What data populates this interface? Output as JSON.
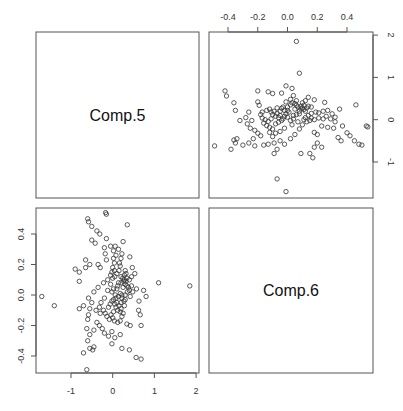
{
  "chart_data": {
    "type": "scatter",
    "title": "",
    "layout": "pairs-matrix 2x2",
    "variables": [
      "Comp.5",
      "Comp.6"
    ],
    "diagonal_labels": [
      "Comp.5",
      "Comp.6"
    ],
    "grid": false,
    "axes": {
      "comp5": {
        "ticks": [
          -0.4,
          -0.2,
          0.0,
          0.2,
          0.4
        ],
        "tick_labels": [
          "-0.4",
          "-0.2",
          "0.0",
          "0.2",
          "0.4"
        ],
        "range": [
          -0.5,
          0.55
        ]
      },
      "comp6": {
        "ticks": [
          -1,
          0,
          1,
          2
        ],
        "tick_labels": [
          "-1",
          "0",
          "1",
          "2"
        ],
        "range": [
          -1.75,
          2.0
        ]
      }
    },
    "panels": [
      {
        "position": "top-right",
        "x_var": "Comp.5",
        "y_var": "Comp.6",
        "x_axis_side": "top",
        "y_axis_side": "right"
      },
      {
        "position": "bottom-left",
        "x_var": "Comp.6",
        "y_var": "Comp.5",
        "x_axis_side": "bottom",
        "y_axis_side": "left"
      }
    ],
    "points_comp5_comp6": [
      [
        0.06,
        1.85
      ],
      [
        0.08,
        1.1
      ],
      [
        -0.49,
        -0.62
      ],
      [
        -0.07,
        -1.4
      ],
      [
        -0.01,
        -1.7
      ],
      [
        -0.42,
        0.68
      ],
      [
        -0.41,
        0.56
      ],
      [
        -0.2,
        0.68
      ],
      [
        -0.1,
        0.62
      ],
      [
        -0.13,
        0.66
      ],
      [
        -0.04,
        0.63
      ],
      [
        -0.01,
        0.8
      ],
      [
        0.03,
        0.74
      ],
      [
        0.04,
        0.57
      ],
      [
        0.14,
        0.53
      ],
      [
        0.18,
        0.47
      ],
      [
        0.25,
        0.41
      ],
      [
        -0.2,
        0.42
      ],
      [
        -0.19,
        0.34
      ],
      [
        -0.26,
        0.18
      ],
      [
        -0.24,
        -0.02
      ],
      [
        -0.18,
        0.12
      ],
      [
        -0.17,
        0.04
      ],
      [
        -0.12,
        0.25
      ],
      [
        -0.09,
        0.2
      ],
      [
        -0.07,
        0.15
      ],
      [
        -0.05,
        0.1
      ],
      [
        -0.04,
        0.27
      ],
      [
        -0.02,
        0.22
      ],
      [
        0.0,
        0.3
      ],
      [
        0.02,
        0.35
      ],
      [
        0.03,
        0.4
      ],
      [
        0.05,
        0.38
      ],
      [
        0.06,
        0.34
      ],
      [
        0.07,
        0.3
      ],
      [
        0.09,
        0.32
      ],
      [
        0.1,
        0.28
      ],
      [
        0.11,
        0.24
      ],
      [
        0.12,
        0.2
      ],
      [
        0.13,
        0.28
      ],
      [
        0.05,
        0.25
      ],
      [
        0.01,
        0.18
      ],
      [
        -0.01,
        0.14
      ],
      [
        -0.06,
        0.05
      ],
      [
        -0.08,
        0.08
      ],
      [
        -0.1,
        0.12
      ],
      [
        -0.11,
        0.02
      ],
      [
        -0.13,
        -0.04
      ],
      [
        -0.15,
        0.0
      ],
      [
        -0.16,
        -0.08
      ],
      [
        -0.14,
        -0.14
      ],
      [
        -0.12,
        -0.18
      ],
      [
        -0.1,
        -0.22
      ],
      [
        -0.08,
        -0.1
      ],
      [
        -0.06,
        -0.06
      ],
      [
        -0.03,
        0.02
      ],
      [
        0.0,
        0.06
      ],
      [
        0.02,
        -0.02
      ],
      [
        0.04,
        0.1
      ],
      [
        0.06,
        0.12
      ],
      [
        0.08,
        0.14
      ],
      [
        0.12,
        0.05
      ],
      [
        0.14,
        0.1
      ],
      [
        0.16,
        0.15
      ],
      [
        0.19,
        0.18
      ],
      [
        0.21,
        0.16
      ],
      [
        0.24,
        0.2
      ],
      [
        0.27,
        0.22
      ],
      [
        0.3,
        0.14
      ],
      [
        0.32,
        0.06
      ],
      [
        0.35,
        0.25
      ],
      [
        0.46,
        0.35
      ],
      [
        0.53,
        -0.15
      ],
      [
        0.54,
        -0.17
      ],
      [
        0.4,
        -0.31
      ],
      [
        0.37,
        -0.15
      ],
      [
        0.42,
        -0.38
      ],
      [
        0.45,
        -0.5
      ],
      [
        0.48,
        -0.58
      ],
      [
        0.5,
        -0.6
      ],
      [
        0.36,
        -0.5
      ],
      [
        0.34,
        -0.42
      ],
      [
        0.31,
        -0.2
      ],
      [
        0.27,
        -0.18
      ],
      [
        0.23,
        -0.15
      ],
      [
        0.2,
        -0.35
      ],
      [
        0.18,
        -0.3
      ],
      [
        0.2,
        -0.55
      ],
      [
        0.18,
        -0.65
      ],
      [
        0.17,
        -0.9
      ],
      [
        0.15,
        -0.8
      ],
      [
        0.23,
        -0.65
      ],
      [
        -0.23,
        -0.45
      ],
      [
        -0.26,
        -0.55
      ],
      [
        -0.22,
        -0.62
      ],
      [
        -0.3,
        -0.6
      ],
      [
        -0.35,
        -0.55
      ],
      [
        -0.36,
        -0.48
      ],
      [
        -0.34,
        -0.45
      ],
      [
        -0.38,
        -0.7
      ],
      [
        -0.32,
        -0.02
      ],
      [
        -0.35,
        0.22
      ],
      [
        -0.36,
        0.4
      ],
      [
        -0.28,
        0.05
      ],
      [
        -0.27,
        -0.1
      ],
      [
        -0.25,
        -0.2
      ],
      [
        -0.22,
        -0.25
      ],
      [
        -0.2,
        -0.32
      ],
      [
        -0.18,
        -0.38
      ],
      [
        -0.16,
        -0.6
      ],
      [
        -0.13,
        -0.58
      ],
      [
        -0.09,
        -0.55
      ],
      [
        -0.05,
        -0.5
      ],
      [
        -0.02,
        -0.58
      ],
      [
        0.02,
        -0.45
      ],
      [
        0.05,
        -0.35
      ],
      [
        0.08,
        -0.22
      ],
      [
        0.1,
        -0.12
      ],
      [
        0.07,
        -0.05
      ],
      [
        0.03,
        -0.12
      ],
      [
        -0.02,
        -0.2
      ],
      [
        -0.05,
        -0.28
      ],
      [
        -0.08,
        -0.32
      ],
      [
        -0.1,
        -0.4
      ],
      [
        -0.12,
        -0.3
      ],
      [
        -0.07,
        -0.7
      ],
      [
        -0.09,
        -0.8
      ],
      [
        0.09,
        -0.8
      ],
      [
        0.11,
        0.0
      ],
      [
        0.13,
        -0.05
      ],
      [
        0.15,
        -0.02
      ],
      [
        0.16,
        0.04
      ],
      [
        0.18,
        0.0
      ],
      [
        0.21,
        0.04
      ],
      [
        0.24,
        0.02
      ],
      [
        0.26,
        0.08
      ],
      [
        0.29,
        0.02
      ],
      [
        0.32,
        -0.05
      ],
      [
        0.1,
        0.4
      ],
      [
        0.12,
        0.45
      ],
      [
        0.06,
        0.45
      ],
      [
        0.02,
        0.48
      ],
      [
        -0.01,
        0.42
      ],
      [
        0.0,
        0.22
      ],
      [
        -0.03,
        0.3
      ],
      [
        0.08,
        0.2
      ],
      [
        0.09,
        0.26
      ],
      [
        0.11,
        0.34
      ],
      [
        -0.05,
        0.2
      ],
      [
        -0.07,
        0.28
      ],
      [
        -0.11,
        0.18
      ],
      [
        -0.14,
        0.22
      ],
      [
        -0.17,
        0.18
      ],
      [
        -0.02,
        0.08
      ],
      [
        0.04,
        0.02
      ],
      [
        -0.04,
        -0.02
      ],
      [
        0.14,
        0.32
      ],
      [
        0.16,
        0.3
      ]
    ]
  }
}
